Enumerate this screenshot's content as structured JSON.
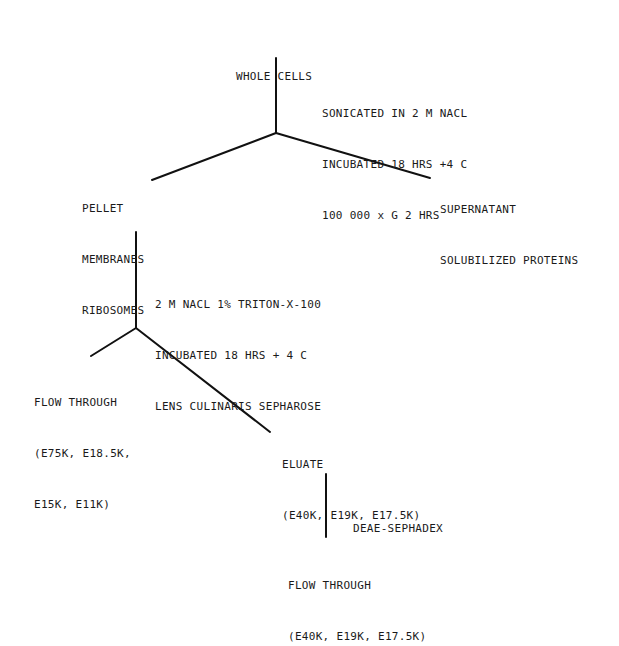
{
  "diagram": {
    "type": "flowchart",
    "line_color": "#111111",
    "nodes": {
      "whole_cells": {
        "lines": [
          "WHOLE CELLS"
        ]
      },
      "step1_conditions": {
        "lines": [
          "SONICATED IN 2 M NACL",
          "INCUBATED 18 HRS +4 C",
          "100 000 x G 2 HRS"
        ]
      },
      "pellet": {
        "lines": [
          "PELLET",
          "MEMBRANES",
          "RIBOSOMES"
        ]
      },
      "supernatant": {
        "lines": [
          "SUPERNATANT",
          "SOLUBILIZED PROTEINS"
        ]
      },
      "step2_conditions": {
        "lines": [
          "2 M NACL 1% TRITON-X-100",
          "INCUBATED 18 HRS + 4 C",
          "LENS CULINARIS SEPHAROSE"
        ]
      },
      "flow_through_1": {
        "lines": [
          "FLOW THROUGH",
          "(E75K, E18.5K,",
          "E15K, E11K)"
        ]
      },
      "eluate": {
        "lines": [
          "ELUATE",
          "(E40K, E19K, E17.5K)"
        ]
      },
      "step3_conditions": {
        "lines": [
          "DEAE-SEPHADEX"
        ]
      },
      "flow_through_2": {
        "lines": [
          "FLOW THROUGH",
          "(E40K, E19K, E17.5K)"
        ]
      }
    },
    "edges": [
      {
        "from": "whole_cells",
        "to": "split_1"
      },
      {
        "from": "split_1",
        "to": "pellet"
      },
      {
        "from": "split_1",
        "to": "supernatant"
      },
      {
        "from": "pellet",
        "to": "split_2"
      },
      {
        "from": "split_2",
        "to": "flow_through_1"
      },
      {
        "from": "split_2",
        "to": "eluate"
      },
      {
        "from": "eluate",
        "to": "flow_through_2"
      }
    ]
  }
}
